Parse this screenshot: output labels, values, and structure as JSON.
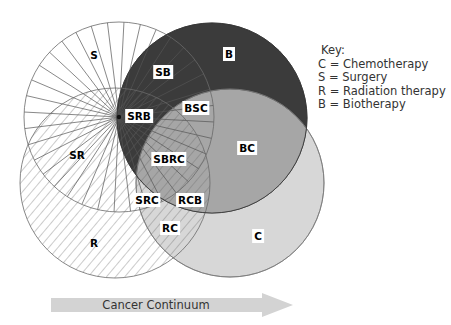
{
  "diagram": {
    "colors": {
      "biotherapy": "#3b3b3b",
      "chemotherapy": "#d7d7d7",
      "biotherapy_chemotherapy_overlap": "#a6a6a6",
      "surgery_rays": "#555555",
      "radiation_hatch": "#666666",
      "outline": "#666666",
      "arrow": "#d3d3d3"
    },
    "circles": [
      {
        "id": "S",
        "name": "Surgery",
        "cx": 119,
        "cy": 117,
        "r": 95,
        "pattern": "radial-lines"
      },
      {
        "id": "R",
        "name": "Radiation therapy",
        "cx": 115,
        "cy": 183,
        "r": 95,
        "pattern": "diagonal-hatch"
      },
      {
        "id": "B",
        "name": "Biotherapy",
        "cx": 212,
        "cy": 118,
        "r": 95,
        "pattern": "dark-fill"
      },
      {
        "id": "C",
        "name": "Chemotherapy",
        "cx": 230,
        "cy": 183,
        "r": 94,
        "pattern": "light-fill"
      }
    ],
    "regions": [
      {
        "label": "S",
        "x": 94,
        "y": 55,
        "boxed": false
      },
      {
        "label": "B",
        "x": 229,
        "y": 54,
        "boxed": true
      },
      {
        "label": "SB",
        "x": 163,
        "y": 72,
        "boxed": true
      },
      {
        "label": "SRB",
        "x": 139,
        "y": 116,
        "boxed": true
      },
      {
        "label": "BSC",
        "x": 196,
        "y": 108,
        "boxed": true
      },
      {
        "label": "SR",
        "x": 77,
        "y": 155,
        "boxed": false
      },
      {
        "label": "SBRC",
        "x": 169,
        "y": 159,
        "boxed": true
      },
      {
        "label": "BC",
        "x": 247,
        "y": 148,
        "boxed": true
      },
      {
        "label": "SRC",
        "x": 147,
        "y": 200,
        "boxed": true
      },
      {
        "label": "RCB",
        "x": 190,
        "y": 200,
        "boxed": true
      },
      {
        "label": "RC",
        "x": 170,
        "y": 228,
        "boxed": true
      },
      {
        "label": "R",
        "x": 94,
        "y": 243,
        "boxed": false
      },
      {
        "label": "C",
        "x": 258,
        "y": 236,
        "boxed": true
      }
    ]
  },
  "key": {
    "title": "Key:",
    "items": [
      {
        "letter": "C",
        "meaning": "Chemotherapy",
        "text": "C = Chemotherapy"
      },
      {
        "letter": "S",
        "meaning": "Surgery",
        "text": "S = Surgery"
      },
      {
        "letter": "R",
        "meaning": "Radiation therapy",
        "text": "R = Radiation therapy"
      },
      {
        "letter": "B",
        "meaning": "Biotherapy",
        "text": "B = Biotherapy"
      }
    ]
  },
  "arrow": {
    "label": "Cancer Continuum"
  }
}
